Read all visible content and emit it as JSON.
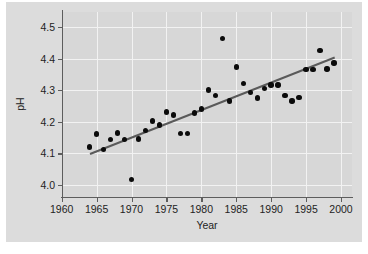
{
  "chart_data": {
    "type": "scatter",
    "title": "",
    "xlabel": "Year",
    "ylabel": "pH",
    "xlim": [
      1960,
      2000
    ],
    "ylim": [
      3.95,
      4.52
    ],
    "xticks": [
      1960,
      1965,
      1970,
      1975,
      1980,
      1985,
      1990,
      1995,
      2000
    ],
    "xtick_labels": [
      "1960",
      "1965",
      "1970",
      "1975",
      "1980",
      "1985",
      "1990",
      "1995",
      "2000"
    ],
    "yticks": [
      4.0,
      4.1,
      4.2,
      4.3,
      4.4,
      4.5
    ],
    "ytick_labels": [
      "4.0",
      "4.1",
      "4.2",
      "4.3",
      "4.4",
      "4.5"
    ],
    "grid": true,
    "grid_color": "#f2f2f2",
    "panel_color": "#d7d7d7",
    "figure_color": "#dcdcdc",
    "point_color": "#0b0b0b",
    "legend": null,
    "legend_position": "none",
    "x": [
      1964,
      1965,
      1966,
      1967,
      1968,
      1969,
      1970,
      1971,
      1972,
      1973,
      1974,
      1975,
      1976,
      1977,
      1978,
      1979,
      1980,
      1981,
      1982,
      1983,
      1984,
      1985,
      1986,
      1987,
      1988,
      1989,
      1990,
      1991,
      1992,
      1993,
      1994,
      1995,
      1996,
      1997,
      1998,
      1999
    ],
    "y": [
      4.12,
      4.162,
      4.112,
      4.144,
      4.164,
      4.144,
      4.018,
      4.145,
      4.172,
      4.203,
      4.19,
      4.231,
      4.221,
      4.163,
      4.163,
      4.228,
      4.241,
      4.301,
      4.284,
      4.464,
      4.266,
      4.374,
      4.321,
      4.292,
      4.275,
      4.305,
      4.316,
      4.316,
      4.284,
      4.266,
      4.276,
      4.366,
      4.366,
      4.425,
      4.367,
      4.386
    ],
    "series": [
      {
        "name": "observations",
        "marker": "filled-circle",
        "values": [
          4.12,
          4.162,
          4.112,
          4.144,
          4.164,
          4.144,
          4.018,
          4.145,
          4.172,
          4.203,
          4.19,
          4.231,
          4.221,
          4.163,
          4.163,
          4.228,
          4.241,
          4.301,
          4.284,
          4.464,
          4.266,
          4.374,
          4.321,
          4.292,
          4.275,
          4.305,
          4.316,
          4.316,
          4.284,
          4.266,
          4.276,
          4.366,
          4.366,
          4.425,
          4.367,
          4.386
        ]
      },
      {
        "name": "regression-line",
        "type": "line",
        "color": "#5a5a5a",
        "x_endpoints": [
          1964,
          1999
        ],
        "y_endpoints": [
          4.1,
          4.405
        ]
      }
    ],
    "points": [
      {
        "x": 1964,
        "y": 4.12
      },
      {
        "x": 1965,
        "y": 4.162
      },
      {
        "x": 1966,
        "y": 4.112
      },
      {
        "x": 1967,
        "y": 4.144
      },
      {
        "x": 1968,
        "y": 4.164
      },
      {
        "x": 1969,
        "y": 4.144
      },
      {
        "x": 1970,
        "y": 4.018
      },
      {
        "x": 1971,
        "y": 4.145
      },
      {
        "x": 1972,
        "y": 4.172
      },
      {
        "x": 1973,
        "y": 4.203
      },
      {
        "x": 1974,
        "y": 4.19
      },
      {
        "x": 1975,
        "y": 4.231
      },
      {
        "x": 1976,
        "y": 4.221
      },
      {
        "x": 1977,
        "y": 4.163
      },
      {
        "x": 1978,
        "y": 4.163
      },
      {
        "x": 1979,
        "y": 4.228
      },
      {
        "x": 1980,
        "y": 4.241
      },
      {
        "x": 1981,
        "y": 4.301
      },
      {
        "x": 1982,
        "y": 4.284
      },
      {
        "x": 1983,
        "y": 4.464
      },
      {
        "x": 1984,
        "y": 4.266
      },
      {
        "x": 1985,
        "y": 4.374
      },
      {
        "x": 1986,
        "y": 4.321
      },
      {
        "x": 1987,
        "y": 4.292
      },
      {
        "x": 1988,
        "y": 4.275
      },
      {
        "x": 1989,
        "y": 4.305
      },
      {
        "x": 1990,
        "y": 4.316
      },
      {
        "x": 1991,
        "y": 4.316
      },
      {
        "x": 1992,
        "y": 4.284
      },
      {
        "x": 1993,
        "y": 4.266
      },
      {
        "x": 1994,
        "y": 4.276
      },
      {
        "x": 1995,
        "y": 4.366
      },
      {
        "x": 1996,
        "y": 4.366
      },
      {
        "x": 1997,
        "y": 4.425
      },
      {
        "x": 1998,
        "y": 4.367
      },
      {
        "x": 1999,
        "y": 4.386
      }
    ]
  }
}
